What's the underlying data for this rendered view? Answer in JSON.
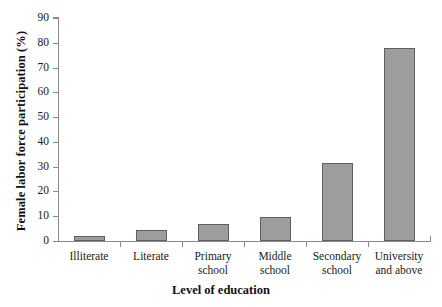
{
  "chart_data": {
    "type": "bar",
    "title": "",
    "xlabel": "Level of education",
    "ylabel": "Female labor force participation (%)",
    "categories": [
      "Illiterate",
      "Literate",
      "Primary school",
      "Middle school",
      "Secondary school",
      "University and above"
    ],
    "category_lines": [
      [
        "Illiterate"
      ],
      [
        "Literate"
      ],
      [
        "Primary",
        "school"
      ],
      [
        "Middle",
        "school"
      ],
      [
        "Secondary",
        "school"
      ],
      [
        "University",
        "and above"
      ]
    ],
    "values": [
      2,
      4.5,
      7,
      9.5,
      31.5,
      78
    ],
    "ylim": [
      0,
      90
    ],
    "yticks": [
      0,
      10,
      20,
      30,
      40,
      50,
      60,
      70,
      80,
      90
    ],
    "ytick_labels": [
      "0",
      "10",
      "20",
      "30",
      "40",
      "50",
      "60",
      "70",
      "80",
      "90"
    ],
    "grid": false,
    "legend": "none",
    "colors": {
      "bar_fill": "#9d9d9d",
      "bar_border": "#5f5f5f",
      "axis": "#8a8a8a",
      "text": "#1a1a1a",
      "background": "#ffffff"
    }
  }
}
